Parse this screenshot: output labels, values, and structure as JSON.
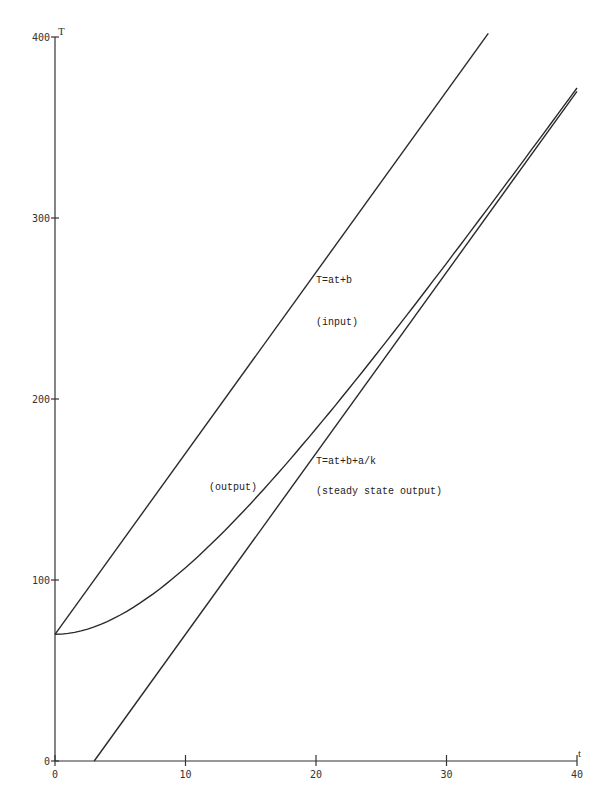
{
  "chart_data": {
    "type": "line",
    "title": "",
    "xlabel": "t",
    "ylabel": "T",
    "xlim": [
      0,
      40
    ],
    "ylim": [
      0,
      400
    ],
    "x_ticks": [
      0,
      10,
      20,
      30,
      40
    ],
    "y_ticks": [
      0,
      100,
      200,
      300,
      400
    ],
    "grid": false,
    "legend": "none",
    "series": [
      {
        "name": "input",
        "formula": "T = 10t + 70",
        "x": [
          0,
          33.2
        ],
        "values": [
          70,
          402
        ]
      },
      {
        "name": "output",
        "formula": "T = 10t - 30 + 100e^(-0.1t)",
        "x": [
          0,
          5,
          10,
          15,
          20,
          25,
          30,
          35,
          40
        ],
        "values": [
          70,
          80.7,
          106.8,
          142.3,
          183.5,
          228.2,
          275.0,
          323.0,
          371.8
        ]
      },
      {
        "name": "steady state output",
        "formula": "T = 10t - 30",
        "x": [
          3,
          40
        ],
        "values": [
          0,
          370
        ]
      }
    ],
    "annotations": [
      {
        "text": "T=at+b",
        "t": 20,
        "T": 270
      },
      {
        "text": "(input)",
        "t": 20,
        "T": 247
      },
      {
        "text": "T=at+b+a/k",
        "t": 20,
        "T": 162
      },
      {
        "text": "(steady state output)",
        "t": 20,
        "T": 140
      },
      {
        "text": "(output)",
        "t": 11.8,
        "T": 150
      }
    ]
  },
  "labels": {
    "x_axis": "t",
    "y_axis": "T",
    "ann_input_eq": "T=at+b",
    "ann_input": "(input)",
    "ann_steady_eq": "T=at+b+a/k",
    "ann_steady": "(steady state output)",
    "ann_output": "(output)"
  }
}
